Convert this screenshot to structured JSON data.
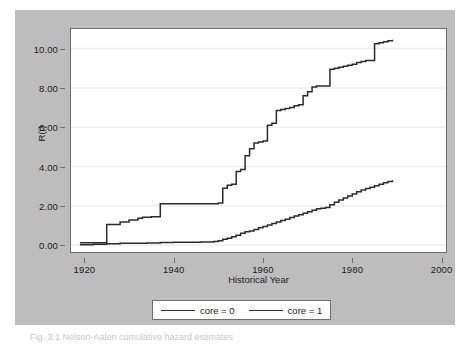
{
  "figure": {
    "caption": "Fig. 3.1   Nelson-Aalen cumulative hazard estimates",
    "panel_color": "#bdbdbd",
    "plot_background": "#ffffff",
    "line_color": "#2b2b2b",
    "grid_color": "#f0f0f0",
    "axis_color": "#6e6e6e"
  },
  "legend": {
    "entries": [
      {
        "label": "core = 0",
        "swatch": "line-swatch"
      },
      {
        "label": "core = 1",
        "swatch": "line-swatch"
      }
    ]
  },
  "chart_data": {
    "type": "line",
    "title": "",
    "subtitle": "",
    "xlabel": "Historical Year",
    "ylabel": "R(t)",
    "xlim": [
      1917,
      2001
    ],
    "ylim": [
      -0.35,
      11.0
    ],
    "xticks": [
      1920,
      1940,
      1960,
      1980,
      2000
    ],
    "xtick_labels": [
      "1920",
      "1940",
      "1960",
      "1980",
      "2000"
    ],
    "yticks": [
      0,
      2,
      4,
      6,
      8,
      10
    ],
    "ytick_labels": [
      "0.00",
      "2.00",
      "4.00",
      "6.00",
      "8.00",
      "10.00"
    ],
    "grid": "horizontal",
    "legend_position": "below-plot",
    "interpolation": "step-post",
    "series": [
      {
        "name": "core = 0",
        "x": [
          1919,
          1921,
          1923,
          1925,
          1925,
          1927,
          1928,
          1930,
          1932,
          1933,
          1935,
          1937,
          1939,
          1942,
          1945,
          1948,
          1950,
          1951,
          1952,
          1953,
          1954,
          1955,
          1956,
          1956,
          1957,
          1958,
          1959,
          1960,
          1961,
          1962,
          1963,
          1964,
          1965,
          1966,
          1967,
          1968,
          1969,
          1970,
          1971,
          1972,
          1973,
          1974,
          1975,
          1976,
          1977,
          1978,
          1979,
          1980,
          1981,
          1982,
          1983,
          1984,
          1985,
          1986,
          1987,
          1988,
          1989
        ],
        "y": [
          0.12,
          0.12,
          0.12,
          0.12,
          1.05,
          1.05,
          1.18,
          1.28,
          1.37,
          1.42,
          1.45,
          2.1,
          2.1,
          2.1,
          2.1,
          2.1,
          2.15,
          2.9,
          3.05,
          3.1,
          3.75,
          3.85,
          4.3,
          4.55,
          4.9,
          5.2,
          5.25,
          5.3,
          6.1,
          6.2,
          6.85,
          6.9,
          6.95,
          7.0,
          7.1,
          7.15,
          7.6,
          7.8,
          8.05,
          8.1,
          8.1,
          8.1,
          8.95,
          9.0,
          9.05,
          9.1,
          9.15,
          9.2,
          9.3,
          9.35,
          9.4,
          9.4,
          10.25,
          10.3,
          10.35,
          10.4,
          10.45
        ]
      },
      {
        "name": "core = 1",
        "x": [
          1919,
          1922,
          1925,
          1928,
          1931,
          1934,
          1937,
          1940,
          1943,
          1946,
          1949,
          1950,
          1951,
          1952,
          1953,
          1954,
          1955,
          1956,
          1957,
          1958,
          1959,
          1960,
          1961,
          1962,
          1963,
          1964,
          1965,
          1966,
          1967,
          1968,
          1969,
          1970,
          1971,
          1972,
          1973,
          1974,
          1975,
          1976,
          1977,
          1978,
          1979,
          1980,
          1981,
          1982,
          1983,
          1984,
          1985,
          1986,
          1987,
          1988,
          1989
        ],
        "y": [
          0.02,
          0.05,
          0.07,
          0.09,
          0.1,
          0.11,
          0.13,
          0.14,
          0.15,
          0.16,
          0.18,
          0.22,
          0.3,
          0.35,
          0.42,
          0.5,
          0.6,
          0.68,
          0.72,
          0.8,
          0.88,
          0.95,
          1.02,
          1.1,
          1.18,
          1.25,
          1.32,
          1.4,
          1.48,
          1.55,
          1.62,
          1.7,
          1.78,
          1.85,
          1.88,
          1.92,
          2.05,
          2.18,
          2.3,
          2.4,
          2.5,
          2.6,
          2.72,
          2.8,
          2.88,
          2.95,
          3.02,
          3.1,
          3.18,
          3.24,
          3.3
        ]
      }
    ]
  }
}
